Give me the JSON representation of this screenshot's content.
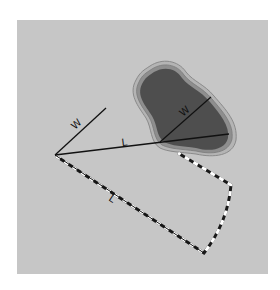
{
  "diagram": {
    "type": "setback-geometry",
    "background_color": "#c6c6c6",
    "pond": {
      "fill_color": "#4e4e4e",
      "rim_color": "#8a8a8a",
      "width_label": "W"
    },
    "origin_lines": {
      "width_label": "W",
      "length_label": "L"
    },
    "zone": {
      "edge_length_label": "L",
      "dash_dark": "#1a1a1a",
      "dash_light": "#ffffff"
    }
  }
}
